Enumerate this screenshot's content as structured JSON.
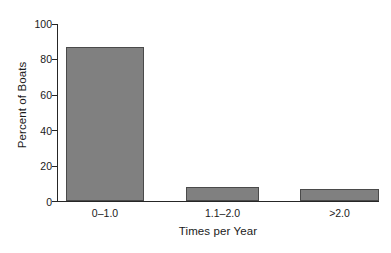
{
  "chart_data": {
    "type": "bar",
    "title": "",
    "subtitle": "",
    "xlabel": "Times per Year",
    "ylabel": "Percent of Boats",
    "categories": [
      "0–1.0",
      "1.1–2.0",
      ">2.0"
    ],
    "values": [
      87,
      8,
      7
    ],
    "ylim": [
      0,
      100
    ],
    "yticks": [
      0,
      20,
      40,
      60,
      80,
      100
    ],
    "ytick_labels": [
      "0",
      "20",
      "40",
      "60",
      "80",
      "100"
    ],
    "grid": false,
    "legend": null,
    "legend_position": "none",
    "bar_fill_color": "#808080",
    "bar_edge_color": "#4a4a4a",
    "axis_color": "#262626",
    "background_color": "#ffffff",
    "annotations": []
  },
  "axis": {
    "y_title": "Percent of Boats",
    "x_title": "Times per Year",
    "y_tick_0": "0",
    "y_tick_1": "20",
    "y_tick_2": "40",
    "y_tick_3": "60",
    "y_tick_4": "80",
    "y_tick_5": "100"
  },
  "bars": [
    {
      "label": "0–1.0",
      "value": "87"
    },
    {
      "label": "1.1–2.0",
      "value": "8"
    },
    {
      "label": ">2.0",
      "value": "7"
    }
  ]
}
